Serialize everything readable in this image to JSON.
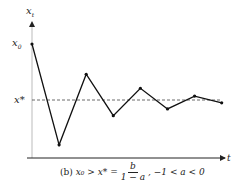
{
  "chart_data": {
    "type": "line",
    "title": "",
    "xlabel": "t",
    "ylabel": "x_t",
    "y_tick_labels": [
      "x0",
      "x*"
    ],
    "reference_line": {
      "label": "x*",
      "style": "dashed",
      "value": 0
    },
    "x": [
      0,
      1,
      2,
      3,
      4,
      5,
      6,
      7
    ],
    "values": [
      1.0,
      -0.8,
      0.46,
      -0.28,
      0.21,
      -0.16,
      0.07,
      -0.05
    ],
    "grid": false,
    "legend": "none",
    "caption": "(b) x0 > x* = b/(1 − a), −1 < a < 0"
  },
  "labels": {
    "y_axis": "x",
    "y_axis_sub": "t",
    "x_axis": "t",
    "x0": "x",
    "x0_sub": "0",
    "xstar": "x*"
  },
  "caption": {
    "prefix": "(b)",
    "lhs": "x₀ > x* =",
    "num": "b",
    "den": "1 − a",
    "cond": ",   −1 < a < 0"
  }
}
